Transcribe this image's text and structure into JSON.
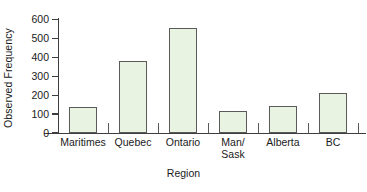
{
  "chart_data": {
    "type": "bar",
    "title": "",
    "xlabel": "Region",
    "ylabel": "Observed Frequency",
    "categories": [
      "Maritimes",
      "Quebec",
      "Ontario",
      "Man/\nSask",
      "Alberta",
      "BC"
    ],
    "values": [
      137,
      381,
      553,
      115,
      143,
      211
    ],
    "ylim": [
      0,
      600
    ],
    "yticks": [
      0,
      100,
      200,
      300,
      400,
      500,
      600
    ],
    "ytick_labels": [
      "0",
      "100",
      "200",
      "300",
      "400",
      "500",
      "600"
    ],
    "grid": false,
    "legend": null,
    "bar_fill_color": "#e8f3e2",
    "bar_border_color": "#5a5a5a",
    "axis_color": "#3d3d3d",
    "background_color": "#ffffff"
  },
  "axes": {
    "y_title": "Observed Frequency",
    "x_title": "Region"
  }
}
